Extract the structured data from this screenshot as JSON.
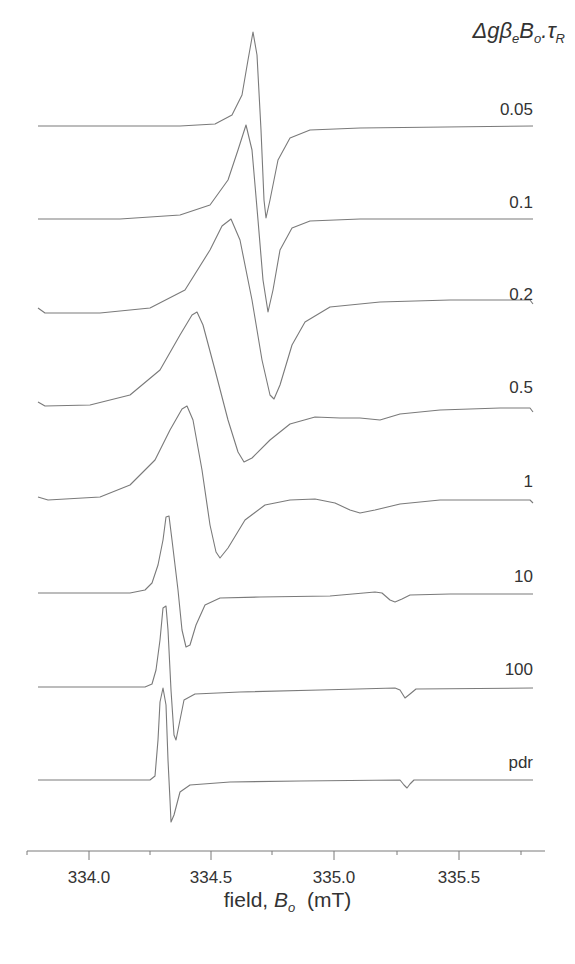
{
  "chart_data": {
    "type": "line",
    "title": "",
    "legend_title": "Δgβ_e B_o.τ_R",
    "legend_title_parts": {
      "delta": "Δ",
      "g": "g",
      "beta": "β",
      "beta_sub": "e",
      "B": "B",
      "B_sub": "o",
      "dot": ".",
      "tau": "τ",
      "tau_sub": "R"
    },
    "xlabel": "field, B_o (mT)",
    "xlabel_parts": {
      "prefix": "field, ",
      "B": "B",
      "B_sub": "o",
      "unit": "(mT)"
    },
    "ylabel": "",
    "xlim": [
      333.75,
      335.83
    ],
    "x_ticks": [
      334.0,
      334.5,
      335.0,
      335.5
    ],
    "x_tick_labels": [
      "334.0",
      "334.5",
      "335.0",
      "335.5"
    ],
    "grid": false,
    "layout": "stacked EPR first-derivative spectra, offset vertically; series label at right above each trace",
    "series": [
      {
        "name": "0.05",
        "center_field": 334.7,
        "positive_peak_field": 334.66,
        "negative_peak_field": 334.71,
        "features": "single narrow derivative line"
      },
      {
        "name": "0.1",
        "center_field": 334.68,
        "positive_peak_field": 334.63,
        "negative_peak_field": 334.72,
        "features": "single derivative line, broader"
      },
      {
        "name": "0.2",
        "center_field": 334.65,
        "positive_peak_field": 334.57,
        "negative_peak_field": 334.73,
        "features": "broadened derivative, baseline rises at high field"
      },
      {
        "name": "0.5",
        "center_field": 334.52,
        "positive_peak_field": 334.43,
        "negative_peak_field": 334.62,
        "features": "broad line, weak shoulder near 335.0-335.3"
      },
      {
        "name": "1",
        "center_field": 334.46,
        "positive_peak_field": 334.39,
        "negative_peak_field": 334.52,
        "features": "broad line, weak dip near 335.2"
      },
      {
        "name": "10",
        "center_field": 334.34,
        "positive_peak_field": 334.32,
        "negative_peak_field": 334.39,
        "features": "narrow line, small dip near 335.37"
      },
      {
        "name": "100",
        "center_field": 334.32,
        "positive_peak_field": 334.3,
        "negative_peak_field": 334.35,
        "features": "narrow line, small dip near 335.44"
      },
      {
        "name": "pdr",
        "center_field": 334.31,
        "positive_peak_field": 334.29,
        "negative_peak_field": 334.33,
        "features": "powder spectrum, narrow line, small dip near 335.46"
      }
    ]
  },
  "traces": [
    {
      "label": "0.05",
      "label_x": 533,
      "label_y": 115,
      "path": "M38,126 L180,126 L215,124 L232,115 L242,95 L248,60 L253,32 L257,55 L261,130 L264,200 L266,218 L270,200 L278,160 L290,138 L310,130 L360,128 L533,126"
    },
    {
      "label": "0.1",
      "label_x": 533,
      "label_y": 208,
      "path": "M38,219 L120,219 L180,215 L210,205 L228,180 L238,150 L246,125 L252,150 L258,220 L263,280 L268,312 L273,290 L280,250 L292,228 L310,221 L360,219 L533,219"
    },
    {
      "label": "0.2",
      "label_x": 533,
      "label_y": 300,
      "path": "M38,308 L45,313 L100,313 L150,308 L185,290 L210,250 L222,226 L231,219 L240,240 L252,300 L262,360 L270,395 L274,399 L280,385 L292,345 L305,322 L330,307 L380,302 L450,300 L530,300 L533,304"
    },
    {
      "label": "0.5",
      "label_x": 533,
      "label_y": 393,
      "path": "M38,402 L45,406 L90,405 L130,395 L160,370 L180,335 L192,315 L197,312 L203,325 L215,370 L228,420 L238,452 L244,462 L252,458 L270,440 L290,424 L315,417 L340,418 L360,418 L380,420 L400,414 L440,410 L500,408 L530,408 L533,412"
    },
    {
      "label": "1",
      "label_x": 533,
      "label_y": 487,
      "path": "M38,497 L48,500 L100,497 L130,485 L155,460 L170,430 L182,409 L187,406 L193,420 L202,470 L210,525 L216,552 L220,558 L228,548 L245,520 L265,505 L290,500 L315,499 L335,503 L350,510 L360,513 L375,510 L400,504 L440,500 L500,500 L530,500 L533,503"
    },
    {
      "label": "10",
      "label_x": 533,
      "label_y": 582,
      "path": "M38,593 L130,593 L145,590 L152,583 L158,565 L163,540 L166,517 L169,516 L172,540 L178,590 L182,630 L186,647 L190,645 L196,625 L205,605 L220,598 L260,597 L330,596 L375,592 L382,593 L390,600 L395,602 L402,599 L410,595 L450,594 L533,594"
    },
    {
      "label": "100",
      "label_x": 533,
      "label_y": 675,
      "path": "M38,687 L145,687 L152,684 L156,670 L160,640 L163,608 L166,606 L168,630 L171,690 L174,735 L176,740 L179,725 L184,700 L195,694 L240,692 L320,690 L395,688 L400,690 L405,698 L410,694 L416,689 L533,688"
    },
    {
      "label": "pdr",
      "label_x": 533,
      "label_y": 768,
      "path": "M38,780 L150,780 L155,776 L158,740 L160,702 L163,688 L166,705 L168,760 L170,800 L171,822 L174,815 L180,792 L190,785 L230,782 L300,781 L400,780 L404,785 L407,788 L410,784 L414,780 L533,780"
    }
  ],
  "axis": {
    "y": 851,
    "x_start": 27,
    "x_end": 545,
    "major_ticks_x": [
      89,
      211,
      334,
      459
    ],
    "minor_ticks_x": [
      27,
      150,
      272,
      397,
      521
    ]
  }
}
